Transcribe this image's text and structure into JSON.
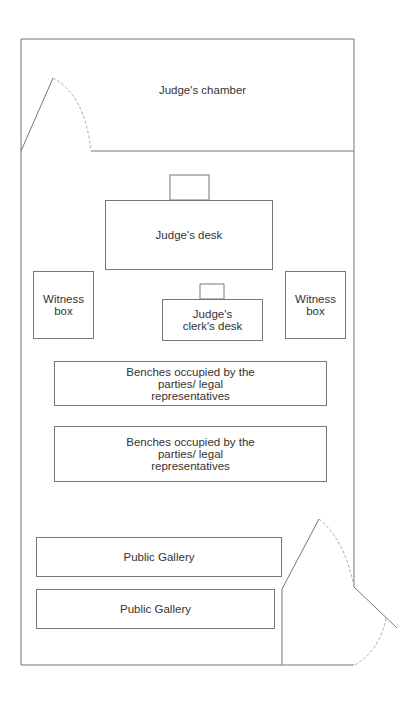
{
  "diagram": {
    "type": "courtroom floor plan",
    "rooms": {
      "judges_chamber": "Judge's chamber"
    },
    "furniture": {
      "judges_desk": "Judge's desk",
      "witness_box_left": "Witness box",
      "witness_box_right": "Witness box",
      "clerks_desk": "Judge's clerk's desk",
      "benches_1": "Benches occupied by the parties/ legal representatives",
      "benches_2": "Benches occupied by the parties/ legal representatives",
      "public_gallery_1": "Public Gallery",
      "public_gallery_2": "Public Gallery"
    },
    "doors": [
      "chamber-door",
      "entrance-door"
    ],
    "colors": {
      "line": "#777777",
      "door_arc": "#aaaaaa",
      "text": "#333333"
    }
  }
}
